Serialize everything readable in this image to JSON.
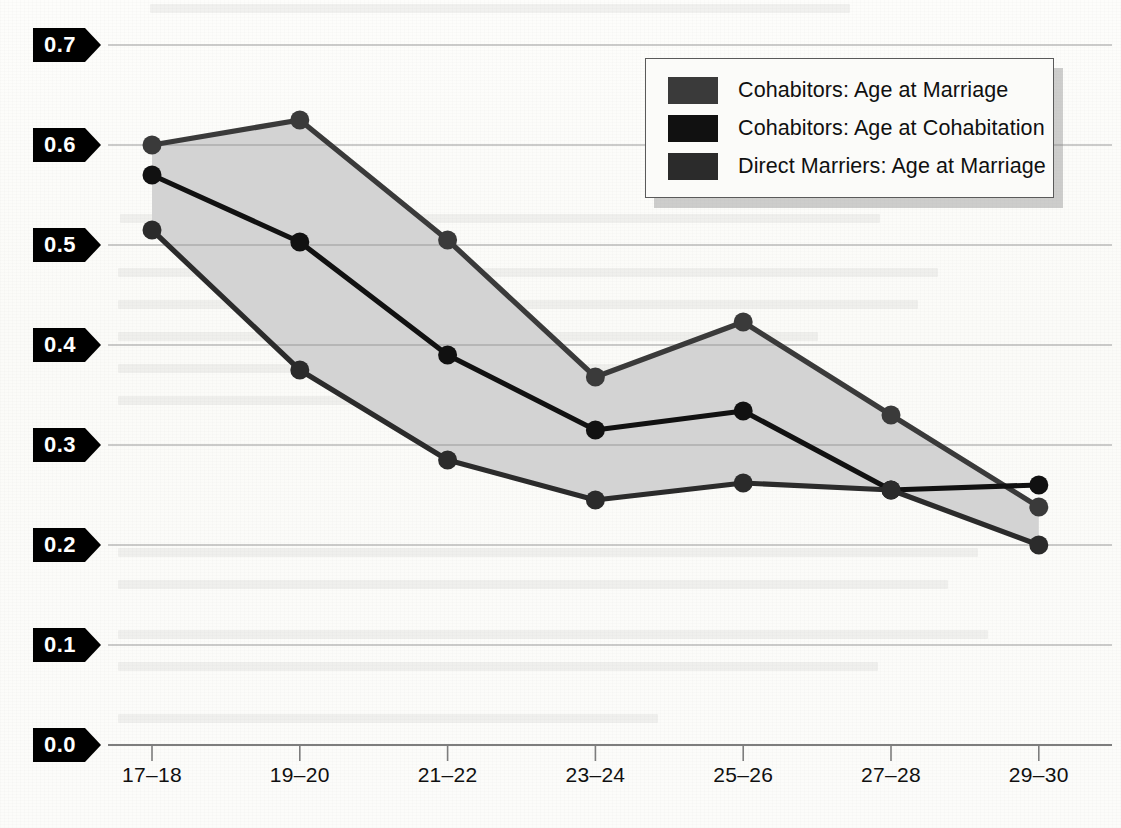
{
  "chart_data": {
    "type": "line",
    "title": "",
    "subtitle": "",
    "xlabel": "",
    "ylabel": "",
    "categories": [
      "17–18",
      "19–20",
      "21–22",
      "23–24",
      "25–26",
      "27–28",
      "29–30"
    ],
    "ylim": [
      0.0,
      0.7
    ],
    "ytick_labels": [
      "0.7",
      "0.6",
      "0.5",
      "0.4",
      "0.3",
      "0.2",
      "0.1",
      "0.0"
    ],
    "ytick_values": [
      0.7,
      0.6,
      0.5,
      0.4,
      0.3,
      0.2,
      0.1,
      0.0
    ],
    "grid": true,
    "legend_position": "top-right",
    "shaded_band": {
      "between": [
        "Cohabitors: Age at Marriage",
        "Direct Marriers: Age at Marriage"
      ],
      "color": "#d3d3d3"
    },
    "series": [
      {
        "name": "Cohabitors: Age at Marriage",
        "color": "#3a3a3a",
        "values": [
          0.6,
          0.625,
          0.505,
          0.368,
          0.423,
          0.33,
          0.238
        ]
      },
      {
        "name": "Cohabitors: Age at Cohabitation",
        "color": "#111111",
        "values": [
          0.57,
          0.503,
          0.39,
          0.315,
          0.334,
          0.255,
          0.26
        ]
      },
      {
        "name": "Direct Marriers: Age at Marriage",
        "color": "#2b2b2b",
        "values": [
          0.515,
          0.375,
          0.285,
          0.245,
          0.262,
          0.255,
          0.2
        ]
      }
    ]
  },
  "legend": {
    "items": [
      {
        "label": "Cohabitors: Age at Marriage",
        "color": "#3a3a3a"
      },
      {
        "label": "Cohabitors: Age at Cohabitation",
        "color": "#111111"
      },
      {
        "label": "Direct Marriers: Age at Marriage",
        "color": "#2b2b2b"
      }
    ]
  },
  "colors": {
    "grid": "#9a9a9a",
    "axis": "#8f8f8f",
    "band": "#d3d3d3",
    "tag_bg": "#000000",
    "tag_text": "#ffffff"
  }
}
